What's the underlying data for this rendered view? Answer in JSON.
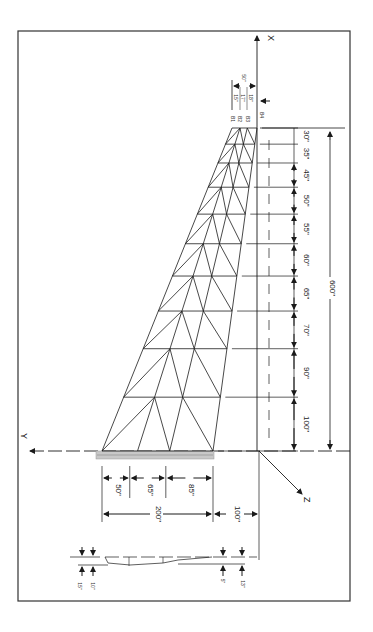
{
  "drawing": {
    "title": "Tapered wing truss structure",
    "colors": {
      "line": "#1a1a1a",
      "frame": "#333333",
      "root_hatch": "#b8b8b8",
      "background": "#ffffff"
    },
    "axes": {
      "x_label": "X",
      "y_label": "Y",
      "z_label": "Z"
    },
    "span_total_label": "600\"",
    "span_segments": [
      {
        "label": "30\"",
        "value": 30
      },
      {
        "label": "35\"",
        "value": 35
      },
      {
        "label": "45\"",
        "value": 45
      },
      {
        "label": "50\"",
        "value": 50
      },
      {
        "label": "55\"",
        "value": 55
      },
      {
        "label": "60\"",
        "value": 60
      },
      {
        "label": "65\"",
        "value": 65
      },
      {
        "label": "70\"",
        "value": 70
      },
      {
        "label": "90\"",
        "value": 90
      },
      {
        "label": "100\"",
        "value": 100
      }
    ],
    "root_chord": {
      "total_label": "200\"",
      "offset_label": "100\"",
      "segments": [
        {
          "label": "50\"",
          "value": 50
        },
        {
          "label": "65\"",
          "value": 65
        },
        {
          "label": "85\"",
          "value": 85
        }
      ]
    },
    "tip": {
      "chord_label": "50\"",
      "node_labels": [
        "B1",
        "B2",
        "B3",
        "B4"
      ],
      "spacing_labels": [
        "15\"",
        "17\"",
        "18\""
      ]
    },
    "thickness": {
      "root_upper_label": "15\"",
      "root_lower_label": "10\"",
      "tip_upper_label": "5\"",
      "tip_lower_label": "13\""
    }
  }
}
